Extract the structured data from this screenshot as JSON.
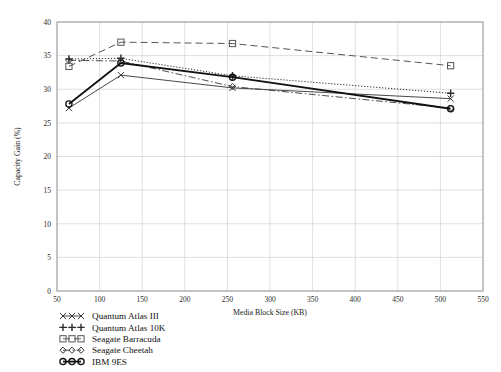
{
  "chart_data": {
    "type": "line",
    "title": "",
    "xlabel": "Media Block Size (KB)",
    "ylabel": "Capacity Gain (%)",
    "xlim": [
      50,
      550
    ],
    "ylim": [
      0,
      40
    ],
    "xticks": [
      50,
      100,
      150,
      200,
      250,
      300,
      350,
      400,
      450,
      500,
      550
    ],
    "yticks": [
      0,
      5,
      10,
      15,
      20,
      25,
      30,
      35,
      40
    ],
    "grid": true,
    "legend_position": "below-left",
    "x": [
      64,
      125,
      256,
      512
    ],
    "series": [
      {
        "name": "Quantum Atlas III",
        "values": [
          27.2,
          32.1,
          30.2,
          28.6
        ],
        "marker": "x",
        "dash": "none",
        "width": 0.9,
        "color": "#333333"
      },
      {
        "name": "Quantum Atlas 10K",
        "values": [
          34.5,
          34.6,
          32.0,
          29.4
        ],
        "marker": "plus",
        "dash": "dotted",
        "width": 1.0,
        "color": "#2b2b2b"
      },
      {
        "name": "Seagate Barracuda",
        "values": [
          33.4,
          37.0,
          36.8,
          33.5
        ],
        "marker": "square",
        "dash": "dashed",
        "width": 1.0,
        "color": "#555555"
      },
      {
        "name": "Seagate Cheetah",
        "values": [
          34.3,
          34.2,
          30.4,
          27.2
        ],
        "marker": "diamond",
        "dash": "dashdot",
        "width": 0.9,
        "color": "#3a3a3a"
      },
      {
        "name": "IBM 9ES",
        "values": [
          27.8,
          33.9,
          31.8,
          27.1
        ],
        "marker": "circle",
        "dash": "none",
        "width": 1.8,
        "color": "#111111"
      }
    ]
  },
  "legend": {
    "items": [
      {
        "label": "Quantum Atlas III"
      },
      {
        "label": "Quantum Atlas 10K"
      },
      {
        "label": "Seagate Barracuda"
      },
      {
        "label": "Seagate Cheetah"
      },
      {
        "label": "IBM 9ES"
      }
    ]
  }
}
